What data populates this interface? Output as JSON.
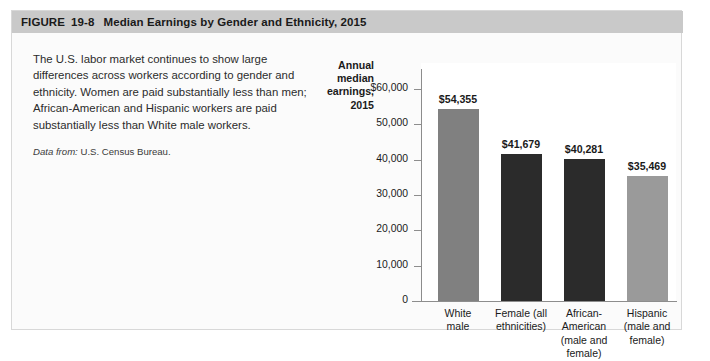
{
  "figure": {
    "header": {
      "figure_word": "FIGURE",
      "number": "19-8",
      "title": "Median Earnings by Gender and Ethnicity, 2015"
    },
    "caption": {
      "body": "The U.S. labor market continues to show large differences across workers according to gender and ethnicity. Women are paid substantially less than men; African-American and Hispanic workers are paid substantially less than White male workers.",
      "source_label": "Data from:",
      "source_value": "U.S. Census Bureau."
    },
    "colors": {
      "header_background": "#c9c9c9",
      "figure_border": "#d8d8d8",
      "figure_background": "#fbfbfb",
      "axis_line": "#8d8d8d",
      "plot_background": "#ffffff"
    }
  },
  "chart_data": {
    "type": "bar",
    "title": "Median Earnings by Gender and Ethnicity, 2015",
    "xlabel": "",
    "ylabel": "Annual median earnings, 2015",
    "ylabel_lines": [
      "Annual",
      "median",
      "earnings,",
      "2015"
    ],
    "categories": [
      "White male",
      "Female (all ethnicities)",
      "African-American (male and female)",
      "Hispanic (male and female)"
    ],
    "category_lines": [
      [
        "White",
        "male"
      ],
      [
        "Female (all",
        "ethnicities)"
      ],
      [
        "African-",
        "American",
        "(male and",
        "female)"
      ],
      [
        "Hispanic",
        "(male and",
        "female)"
      ]
    ],
    "values": [
      54355,
      41679,
      40281,
      35469
    ],
    "value_labels": [
      "$54,355",
      "$41,679",
      "$40,281",
      "$35,469"
    ],
    "bar_colors": [
      "#808080",
      "#2b2b2b",
      "#2b2b2b",
      "#9a9a9a"
    ],
    "ylim": [
      0,
      60000
    ],
    "yticks": [
      60000,
      50000,
      40000,
      30000,
      20000,
      10000,
      0
    ],
    "ytick_labels": [
      "$60,000",
      "50,000",
      "40,000",
      "30,000",
      "20,000",
      "10,000",
      "0"
    ],
    "grid": false,
    "legend": null
  }
}
